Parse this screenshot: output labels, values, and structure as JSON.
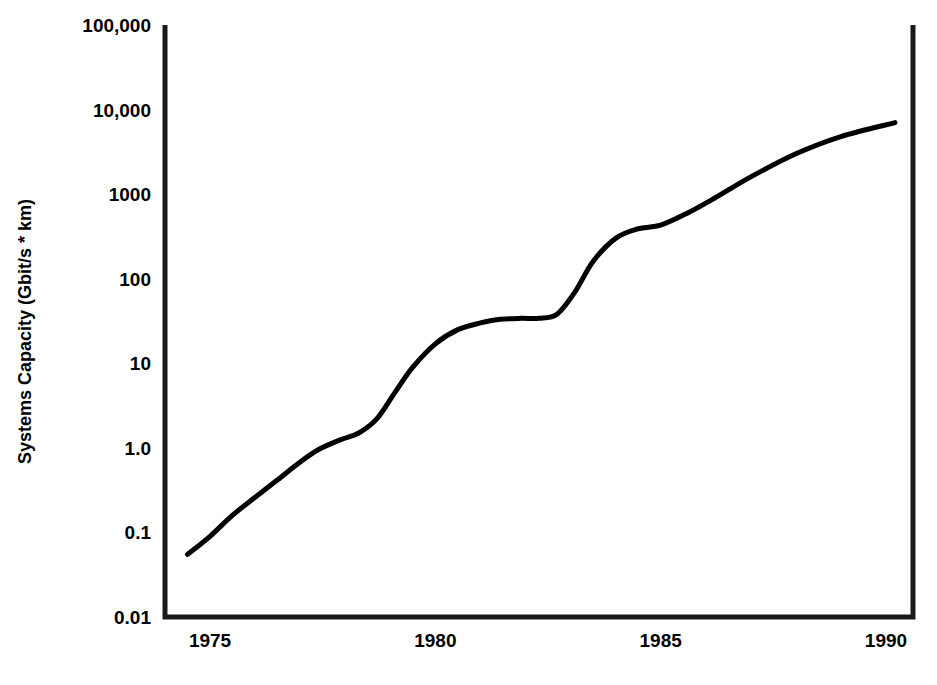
{
  "chart_data": {
    "type": "line",
    "title": "",
    "xlabel": "",
    "ylabel": "Systems Capacity (Gbit/s * km)",
    "xlim": [
      1974.0,
      1990.6
    ],
    "ylim": [
      0.01,
      100000
    ],
    "yscale": "log",
    "grid": false,
    "legend": null,
    "line_color": "#000000",
    "line_width": 5,
    "frame_color": "#1a1a1a",
    "background": "#ffffff",
    "xticks": [
      1975,
      1980,
      1985,
      1990
    ],
    "xticklabels": [
      "1975",
      "1980",
      "1985",
      "1990"
    ],
    "yticks": [
      0.01,
      0.1,
      1.0,
      10,
      100,
      1000,
      10000,
      100000
    ],
    "yticklabels": [
      "0.01",
      "0.1",
      "1.0",
      "10",
      "100",
      "1000",
      "10,000",
      "100,000"
    ],
    "series": [
      {
        "name": "Systems Capacity",
        "x": [
          1974.5,
          1975.0,
          1975.5,
          1976.0,
          1976.5,
          1977.0,
          1977.4,
          1977.9,
          1978.3,
          1978.7,
          1979.1,
          1979.5,
          1980.0,
          1980.5,
          1981.0,
          1981.4,
          1981.9,
          1982.3,
          1982.7,
          1983.1,
          1983.5,
          1984.0,
          1984.5,
          1985.0,
          1985.6,
          1986.2,
          1987.0,
          1988.0,
          1989.0,
          1990.2
        ],
        "y": [
          0.055,
          0.09,
          0.16,
          0.26,
          0.42,
          0.68,
          0.95,
          1.25,
          1.5,
          2.2,
          4.5,
          9.0,
          17.0,
          25.0,
          30.0,
          33.0,
          34.0,
          34.0,
          38.0,
          70.0,
          160.0,
          300.0,
          390.0,
          430.0,
          600.0,
          900.0,
          1600.0,
          3000.0,
          4800.0,
          7000.0
        ]
      }
    ]
  },
  "axes": {
    "frame": {
      "left": 165,
      "top": 25,
      "right": 913,
      "bottom": 617
    }
  }
}
